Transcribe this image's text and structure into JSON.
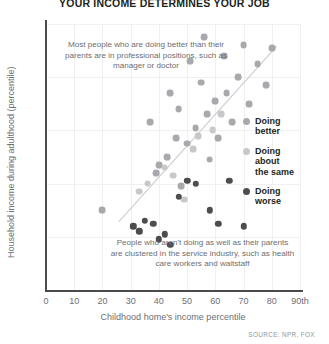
{
  "title": "YOUR INCOME DETERMINES YOUR JOB",
  "source": "SOURCE: NPR, FOX",
  "annotations": {
    "top": "Most people who are doing better than their parents are in professional positions, such as manager or doctor",
    "bottom": "People who aren't doing as well as their parents are clustered in the service industry, such as health care workers and waitstaff"
  },
  "legend": {
    "items": [
      {
        "label": "Doing\nbetter",
        "color": "#a7a9ac"
      },
      {
        "label": "Doing\nabout\nthe same",
        "color": "#c7c8ca"
      },
      {
        "label": "Doing\nworse",
        "color": "#4d4d4f"
      }
    ]
  },
  "chart_data": {
    "type": "scatter",
    "title": "YOUR INCOME DETERMINES YOUR JOB",
    "xlabel": "Childhood home's income percentile",
    "ylabel": "Household income during adulthood (percentile)",
    "xlim": [
      0,
      90
    ],
    "ylim": [
      0,
      100
    ],
    "xticks": [
      "0",
      "10",
      "20",
      "30",
      "40",
      "50",
      "60",
      "70",
      "80",
      "90th"
    ],
    "xtick_values": [
      0,
      10,
      20,
      30,
      40,
      50,
      60,
      70,
      80,
      90
    ],
    "yticks": [
      "0",
      "20",
      "40",
      "60",
      "80",
      "100th"
    ],
    "ytick_values": [
      0,
      20,
      40,
      60,
      80,
      100
    ],
    "grid": true,
    "legend_position": "right",
    "trendline": {
      "x0": 26,
      "y0": 26,
      "x1": 82,
      "y1": 92
    },
    "series": [
      {
        "name": "Doing better",
        "color": "#a7a9ac",
        "points": [
          [
            20,
            30
          ],
          [
            37,
            63
          ],
          [
            39,
            44
          ],
          [
            40,
            47
          ],
          [
            43,
            50
          ],
          [
            44,
            74
          ],
          [
            46,
            57
          ],
          [
            47,
            68
          ],
          [
            48,
            39
          ],
          [
            50,
            55
          ],
          [
            51,
            86
          ],
          [
            53,
            61
          ],
          [
            55,
            78
          ],
          [
            56,
            95
          ],
          [
            57,
            66
          ],
          [
            58,
            49
          ],
          [
            60,
            71
          ],
          [
            61,
            57
          ],
          [
            63,
            88
          ],
          [
            64,
            74
          ],
          [
            66,
            63
          ],
          [
            68,
            80
          ],
          [
            70,
            92
          ],
          [
            72,
            70
          ],
          [
            75,
            85
          ],
          [
            78,
            77
          ],
          [
            80,
            91
          ]
        ]
      },
      {
        "name": "Doing about the same",
        "color": "#c7c8ca",
        "points": [
          [
            33,
            37
          ],
          [
            36,
            40
          ],
          [
            42,
            46
          ],
          [
            45,
            43
          ],
          [
            52,
            53
          ],
          [
            54,
            58
          ],
          [
            59,
            60
          ],
          [
            62,
            66
          ],
          [
            49,
            34
          ]
        ]
      },
      {
        "name": "Doing worse",
        "color": "#4d4d4f",
        "points": [
          [
            31,
            24
          ],
          [
            33,
            22
          ],
          [
            35,
            26
          ],
          [
            40,
            19
          ],
          [
            42,
            21
          ],
          [
            44,
            17
          ],
          [
            47,
            35
          ],
          [
            50,
            41
          ],
          [
            53,
            40
          ],
          [
            58,
            30
          ],
          [
            61,
            25
          ],
          [
            65,
            41
          ],
          [
            70,
            24
          ],
          [
            38,
            25
          ]
        ]
      }
    ]
  }
}
